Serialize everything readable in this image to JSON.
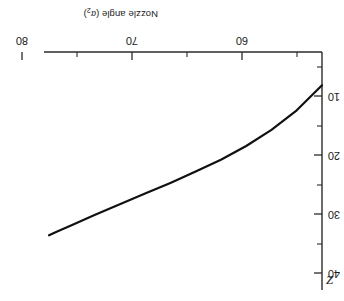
{
  "chart_data": {
    "type": "line",
    "title": "",
    "xlabel": "Nozzle angle (α₂)",
    "ylabel": "Z",
    "xlabel_main": "Nozzle angle (",
    "xlabel_symbol": "α",
    "xlabel_subscript": "2",
    "xlabel_close": ")",
    "xlim": [
      80,
      58
    ],
    "ylim": [
      0,
      40
    ],
    "x_ticks": [
      80,
      70,
      60
    ],
    "x_tick_labels": [
      "80",
      "70",
      "60"
    ],
    "x_minor_ticks": [
      75,
      65,
      58
    ],
    "y_ticks": [
      10,
      20,
      30,
      40
    ],
    "y_tick_labels": [
      "10",
      "20",
      "30",
      "40"
    ],
    "y_minor_ticks": [
      5,
      15,
      25,
      35
    ],
    "grid": false,
    "legend": null,
    "orientation": "rotated-180",
    "axis_position": "x-axis-top, y-axis-right",
    "series": [
      {
        "name": "Z vs nozzle angle",
        "x": [
          80.0,
          78.0,
          76.0,
          74.0,
          72.0,
          70.0,
          68.0,
          66.0,
          64.0,
          62.0,
          60.0,
          59.0,
          58.4
        ],
        "y": [
          34.4,
          30.2,
          26.9,
          24.2,
          21.9,
          19.9,
          18.0,
          16.2,
          14.4,
          12.6,
          10.7,
          9.8,
          9.2
        ],
        "color": "#111111",
        "linewidth": 2.2
      }
    ]
  },
  "render": {
    "plot_left_px": 22,
    "plot_right_px": 300,
    "plot_top_px": 52,
    "plot_bottom_px": 290,
    "background": "#ffffff",
    "axis_color": "#2b2b2b"
  }
}
